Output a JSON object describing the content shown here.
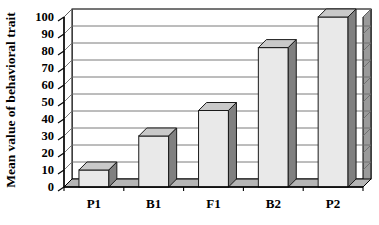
{
  "chart_data": {
    "type": "bar",
    "title": "",
    "subtitle": "",
    "xlabel": "",
    "ylabel": "Mean value of behavioral trait",
    "categories": [
      "P1",
      "B1",
      "F1",
      "B2",
      "P2"
    ],
    "values": [
      10,
      30,
      45,
      82,
      100
    ],
    "series": [
      {
        "name": "Mean value of behavioral trait",
        "values": [
          10,
          30,
          45,
          82,
          100
        ]
      }
    ],
    "ylim": [
      0,
      100
    ],
    "ytick_step": 10,
    "yticks": [
      0,
      10,
      20,
      30,
      40,
      50,
      60,
      70,
      80,
      90,
      100
    ],
    "ytick_labels": [
      "0",
      "10",
      "20",
      "30",
      "40",
      "50",
      "60",
      "70",
      "80",
      "90",
      "100"
    ],
    "grid": true,
    "grid_axis": "y",
    "legend": false,
    "legend_position": "none",
    "style_3d": true,
    "annotations": []
  },
  "colors": {
    "bar_front": "#e9e9e9",
    "bar_side": "#808080",
    "bar_top": "#c9c9c9",
    "bar_outline": "#1a1a1a",
    "wall_back": "#ffffff",
    "wall_side": "#9a9a9a",
    "floor": "#b5b5b5",
    "grid_line": "#6b6b6b",
    "axis_line": "#000000",
    "text": "#000000",
    "background": "#ffffff"
  },
  "axis": {
    "y_title": "Mean value of behavioral trait"
  }
}
